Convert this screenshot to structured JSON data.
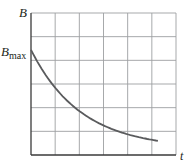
{
  "chart_data": {
    "type": "line",
    "title": "",
    "xlabel": "t",
    "ylabel": "B",
    "y_tick_labels": [
      {
        "label": "B",
        "subscript": "max",
        "value": 1.0
      }
    ],
    "x_tick_labels": [],
    "grid": true,
    "grid_columns": 6,
    "grid_rows": 6,
    "xlim": [
      0,
      6
    ],
    "ylim": [
      0,
      1.35
    ],
    "series": [
      {
        "name": "B(t)",
        "x": [
          0,
          0.5,
          1,
          1.5,
          2,
          2.5,
          3,
          3.5,
          4,
          4.5,
          5,
          5.25
        ],
        "values": [
          1.0,
          0.78,
          0.61,
          0.48,
          0.38,
          0.29,
          0.22,
          0.16,
          0.12,
          0.1,
          0.085,
          0.08
        ]
      }
    ],
    "colors": {
      "curve": "#5a5b5d",
      "grid": "#9d9fa2",
      "axis": "#3a3a3a",
      "text": "#231f20"
    }
  },
  "labels": {
    "y_axis": "B",
    "x_axis": "t",
    "bmax_main": "B",
    "bmax_sub": "max"
  }
}
